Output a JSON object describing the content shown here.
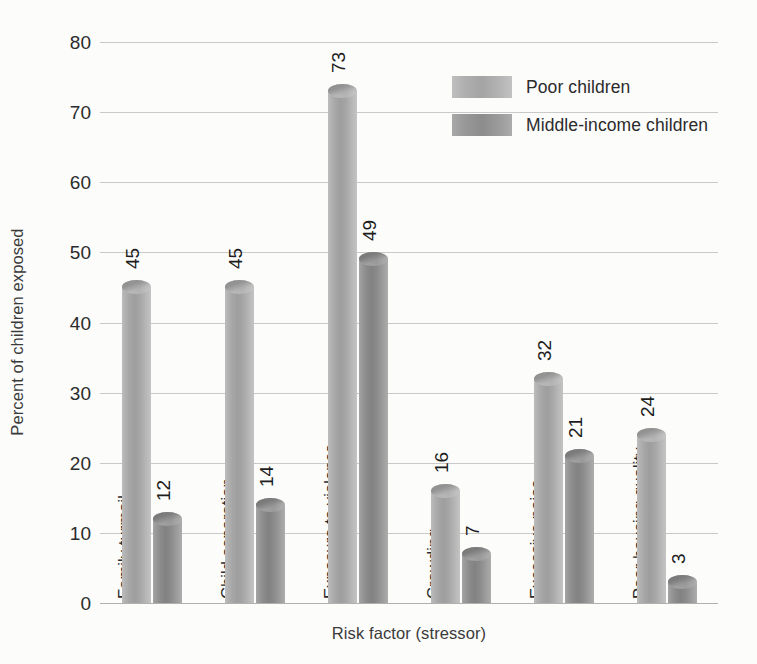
{
  "chart_data": {
    "type": "bar",
    "title": "",
    "xlabel": "Risk factor (stressor)",
    "ylabel": "Percent of children exposed",
    "ylim": [
      0,
      80
    ],
    "yticks": [
      0,
      10,
      20,
      30,
      40,
      50,
      60,
      70,
      80
    ],
    "grid": true,
    "legend_position": "top-right",
    "categories": [
      "Family turmoil",
      "Child separation",
      "Exposure to violence",
      "Crowding",
      "Excessive noise",
      "Poor housing quality"
    ],
    "series": [
      {
        "name": "Poor children",
        "color": "#a4a4a4",
        "values": [
          45,
          45,
          73,
          16,
          32,
          24
        ]
      },
      {
        "name": "Middle-income children",
        "color": "#8c8c8c",
        "values": [
          12,
          14,
          49,
          7,
          21,
          3
        ]
      }
    ]
  },
  "axes": {
    "y_tick_labels": [
      "0",
      "10",
      "20",
      "30",
      "40",
      "50",
      "60",
      "70",
      "80"
    ],
    "y_title": "Percent of children exposed",
    "x_title": "Risk factor (stressor)"
  },
  "legend": {
    "entries": [
      {
        "label": "Poor children",
        "swatch": "light-gray-swatch"
      },
      {
        "label": "Middle-income children",
        "swatch": "dark-gray-swatch"
      }
    ]
  },
  "value_labels": {
    "poor_children": [
      "45",
      "45",
      "73",
      "16",
      "32",
      "24"
    ],
    "middle_income_children": [
      "12",
      "14",
      "49",
      "7",
      "21",
      "3"
    ]
  },
  "colors": {
    "background": "#fcfcfb",
    "gridline": "#c9c9c9",
    "baseline": "#b0b0b0",
    "series_light": "#a4a4a4",
    "series_dark": "#8c8c8c",
    "text": "#2b2b2b"
  }
}
